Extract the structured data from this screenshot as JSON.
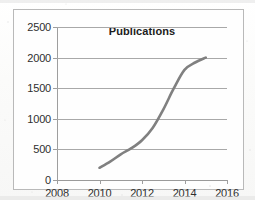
{
  "chart_data": {
    "type": "line",
    "title": "Publications",
    "xlabel": "",
    "ylabel": "",
    "xlim": [
      2008,
      2016
    ],
    "ylim": [
      0,
      2500
    ],
    "xticks": [
      2008,
      2010,
      2012,
      2014,
      2016
    ],
    "yticks": [
      0,
      500,
      1000,
      1500,
      2000,
      2500
    ],
    "xtick_labels": [
      "2008",
      "2010",
      "2012",
      "2014",
      "2016"
    ],
    "ytick_labels": [
      "0",
      "500",
      "1000",
      "1500",
      "2000",
      "2500"
    ],
    "grid": "horizontal",
    "legend": "none",
    "series": [
      {
        "name": "Publications",
        "color": "#808080",
        "x": [
          2010,
          2010.5,
          2011,
          2011.5,
          2012,
          2012.5,
          2013,
          2013.5,
          2014,
          2014.5,
          2015
        ],
        "values": [
          200,
          300,
          420,
          520,
          650,
          850,
          1150,
          1500,
          1800,
          1920,
          2000
        ]
      }
    ]
  },
  "colors": {
    "series_line": "#808080",
    "gridline": "#a8a8a8",
    "axis": "#9e9e9e",
    "border": "#b9b9b9",
    "text": "#2f2f2f",
    "title_text": "#1c1c1c",
    "background": "#fefefe"
  }
}
